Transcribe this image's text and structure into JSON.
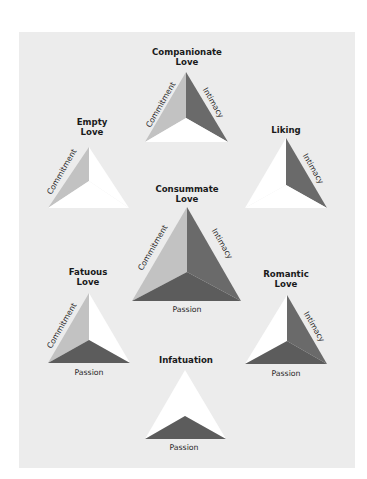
{
  "colors": {
    "panel": "#ececec",
    "commitment": "#c2c2c2",
    "intimacy": "#6a6a6a",
    "passion": "#5c5c5c",
    "empty_face": "#ffffff"
  },
  "labels": {
    "commitment": "Commitment",
    "intimacy": "Intimacy",
    "passion": "Passion"
  },
  "triangles": [
    {
      "id": "companionate",
      "title_line1": "Companionate",
      "title_line2": "Love",
      "components": [
        "Commitment",
        "Intimacy"
      ]
    },
    {
      "id": "empty",
      "title_line1": "Empty",
      "title_line2": "Love",
      "components": [
        "Commitment"
      ]
    },
    {
      "id": "liking",
      "title_line1": "Liking",
      "title_line2": "",
      "components": [
        "Intimacy"
      ]
    },
    {
      "id": "consummate",
      "title_line1": "Consummate",
      "title_line2": "Love",
      "components": [
        "Commitment",
        "Intimacy",
        "Passion"
      ]
    },
    {
      "id": "fatuous",
      "title_line1": "Fatuous",
      "title_line2": "Love",
      "components": [
        "Commitment",
        "Passion"
      ]
    },
    {
      "id": "romantic",
      "title_line1": "Romantic",
      "title_line2": "Love",
      "components": [
        "Intimacy",
        "Passion"
      ]
    },
    {
      "id": "infatuation",
      "title_line1": "Infatuation",
      "title_line2": "",
      "components": [
        "Passion"
      ]
    }
  ]
}
